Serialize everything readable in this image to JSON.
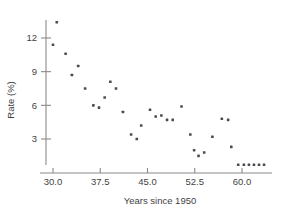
{
  "chart_data": {
    "type": "scatter",
    "title": "",
    "subtitle": "",
    "xlabel": "Years since 1950",
    "ylabel": "Rate (%)",
    "xlim": [
      28.0,
      64.5
    ],
    "ylim": [
      0.0,
      13.8
    ],
    "xticks": [
      30.0,
      37.5,
      45.0,
      52.5,
      60.0
    ],
    "xticklabels": [
      "30.0",
      "37.5",
      "45.0",
      "52.5",
      "60.0"
    ],
    "yticks": [
      3,
      6,
      9,
      12
    ],
    "yticklabels": [
      "3",
      "6",
      "9",
      "12"
    ],
    "grid": false,
    "legend": null,
    "marker": "square",
    "marker_color": "#4a4a52",
    "marker_size": 2.6,
    "axis_color": "#8a8a8a",
    "points": [
      {
        "x": 30.0,
        "y": 11.4
      },
      {
        "x": 30.6,
        "y": 13.4
      },
      {
        "x": 32.0,
        "y": 10.6
      },
      {
        "x": 33.0,
        "y": 8.7
      },
      {
        "x": 34.0,
        "y": 9.5
      },
      {
        "x": 35.1,
        "y": 7.5
      },
      {
        "x": 36.4,
        "y": 6.0
      },
      {
        "x": 37.3,
        "y": 5.8
      },
      {
        "x": 38.2,
        "y": 6.7
      },
      {
        "x": 39.1,
        "y": 8.1
      },
      {
        "x": 40.0,
        "y": 7.5
      },
      {
        "x": 41.1,
        "y": 5.4
      },
      {
        "x": 42.4,
        "y": 3.4
      },
      {
        "x": 43.3,
        "y": 3.0
      },
      {
        "x": 44.0,
        "y": 4.2
      },
      {
        "x": 45.4,
        "y": 5.6
      },
      {
        "x": 46.3,
        "y": 5.0
      },
      {
        "x": 47.2,
        "y": 5.1
      },
      {
        "x": 48.1,
        "y": 4.7
      },
      {
        "x": 49.0,
        "y": 4.7
      },
      {
        "x": 50.4,
        "y": 5.9
      },
      {
        "x": 51.8,
        "y": 3.4
      },
      {
        "x": 52.4,
        "y": 2.0
      },
      {
        "x": 53.1,
        "y": 1.5
      },
      {
        "x": 54.0,
        "y": 1.8
      },
      {
        "x": 55.3,
        "y": 3.2
      },
      {
        "x": 56.8,
        "y": 4.8
      },
      {
        "x": 57.8,
        "y": 4.7
      },
      {
        "x": 58.3,
        "y": 2.3
      },
      {
        "x": 59.4,
        "y": 0.7
      },
      {
        "x": 60.3,
        "y": 0.7
      },
      {
        "x": 61.1,
        "y": 0.7
      },
      {
        "x": 61.9,
        "y": 0.7
      },
      {
        "x": 62.7,
        "y": 0.7
      },
      {
        "x": 63.5,
        "y": 0.7
      }
    ]
  }
}
